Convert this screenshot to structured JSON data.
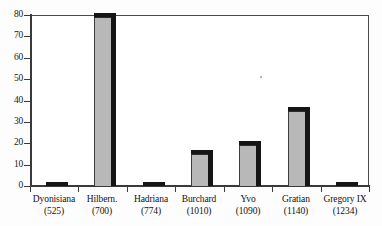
{
  "chart_data": {
    "type": "bar",
    "title": "",
    "subtitle": "",
    "xlabel": "",
    "ylabel": "",
    "categories": [
      "Dyonisiana",
      "Hilbern.",
      "Hadriana",
      "Burchard",
      "Yvo",
      "Gratian",
      "Gregory IX"
    ],
    "category_years": [
      "(525)",
      "(700)",
      "(774)",
      "(1010)",
      "(1090)",
      "(1140)",
      "(1234)"
    ],
    "values": [
      1,
      79,
      1,
      15,
      19,
      35,
      1
    ],
    "ylim": [
      0,
      80
    ],
    "yticks": [
      0,
      10,
      20,
      30,
      40,
      50,
      60,
      70,
      80
    ],
    "ytick_labels": [
      "0",
      "10",
      "20",
      "30",
      "40",
      "50",
      "60",
      "70",
      "80"
    ],
    "grid": false,
    "legend": null,
    "legend_position": "none",
    "bar_fill_color": "#b8b8b8",
    "bar_edge_color": "#151515",
    "axis_color": "#3a3a3a",
    "background_color": "#ffffff"
  }
}
